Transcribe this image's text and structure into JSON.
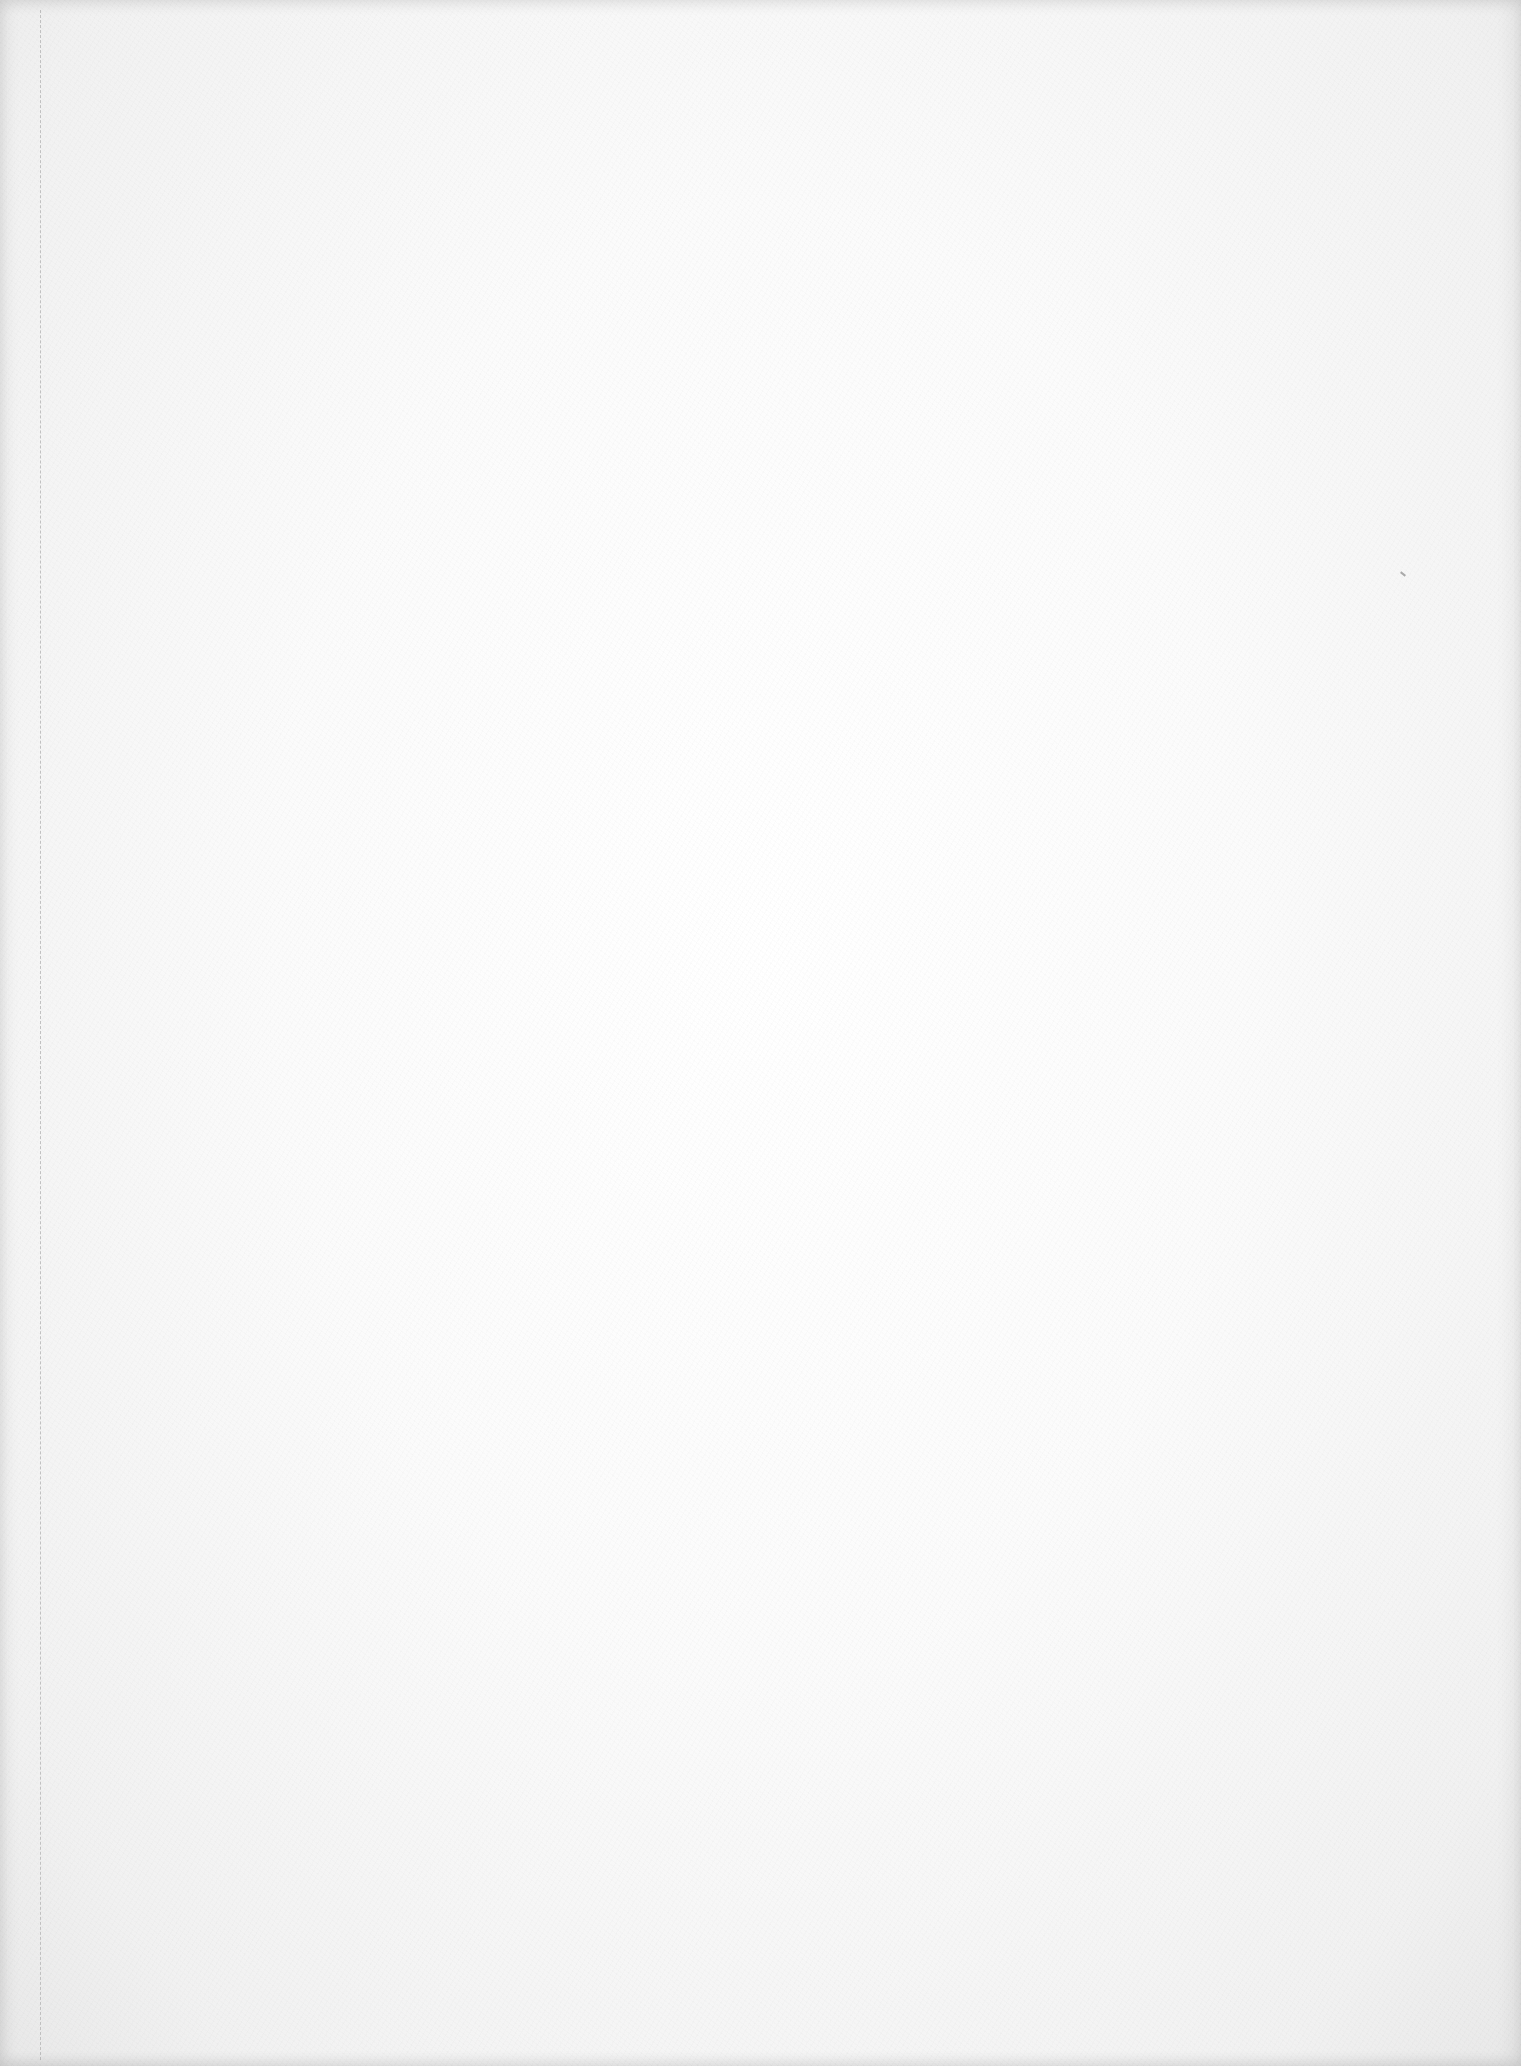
{
  "page": {
    "kind": "blank-scanned-page",
    "text_content": "",
    "background_color": "#fbfbfb",
    "edge_shade_color": "#e8e8e8"
  },
  "marks": {
    "fold_line": {
      "style": "dashed",
      "orientation": "vertical",
      "color": "#b9b9b9"
    },
    "speck": {
      "color": "#8a8a8a"
    }
  }
}
